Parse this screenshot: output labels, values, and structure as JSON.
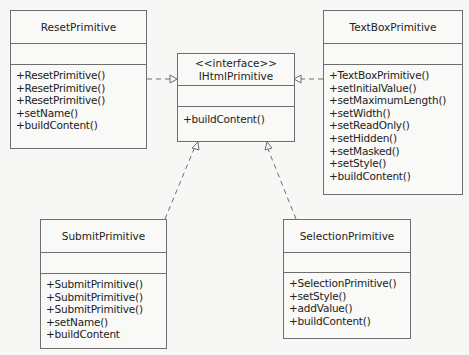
{
  "diagram": {
    "type": "UML class diagram",
    "classes": [
      {
        "id": "reset",
        "stereotype": "",
        "name": "ResetPrimitive",
        "attributes": [],
        "operations": [
          "+ResetPrimitive()",
          "+ResetPrimitive()",
          "+ResetPrimitive()",
          "+setName()",
          "+buildContent()"
        ]
      },
      {
        "id": "ihtml",
        "stereotype": "<<interface>>",
        "name": "IHtmlPrimitive",
        "attributes": [],
        "operations": [
          "+buildContent()"
        ]
      },
      {
        "id": "textbox",
        "stereotype": "",
        "name": "TextBoxPrimitive",
        "attributes": [],
        "operations": [
          "+TextBoxPrimitive()",
          "+setInitialValue()",
          "+setMaximumLength()",
          "+setWidth()",
          "+setReadOnly()",
          "+setHidden()",
          "+setMasked()",
          "+setStyle()",
          "+buildContent()"
        ]
      },
      {
        "id": "submit",
        "stereotype": "",
        "name": "SubmitPrimitive",
        "attributes": [],
        "operations": [
          "+SubmitPrimitive()",
          "+SubmitPrimitive()",
          "+SubmitPrimitive()",
          "+setName()",
          "+buildContent"
        ]
      },
      {
        "id": "selection",
        "stereotype": "",
        "name": "SelectionPrimitive",
        "attributes": [],
        "operations": [
          "+SelectionPrimitive()",
          "+setStyle()",
          "+addValue()",
          "+buildContent()"
        ]
      }
    ],
    "relationships": [
      {
        "from": "ResetPrimitive",
        "to": "IHtmlPrimitive",
        "type": "realization"
      },
      {
        "from": "TextBoxPrimitive",
        "to": "IHtmlPrimitive",
        "type": "realization"
      },
      {
        "from": "SubmitPrimitive",
        "to": "IHtmlPrimitive",
        "type": "realization"
      },
      {
        "from": "SelectionPrimitive",
        "to": "IHtmlPrimitive",
        "type": "realization"
      }
    ],
    "colors": {
      "background": "#f7f7f5",
      "line": "#6e6e6e",
      "text": "#222222"
    }
  }
}
